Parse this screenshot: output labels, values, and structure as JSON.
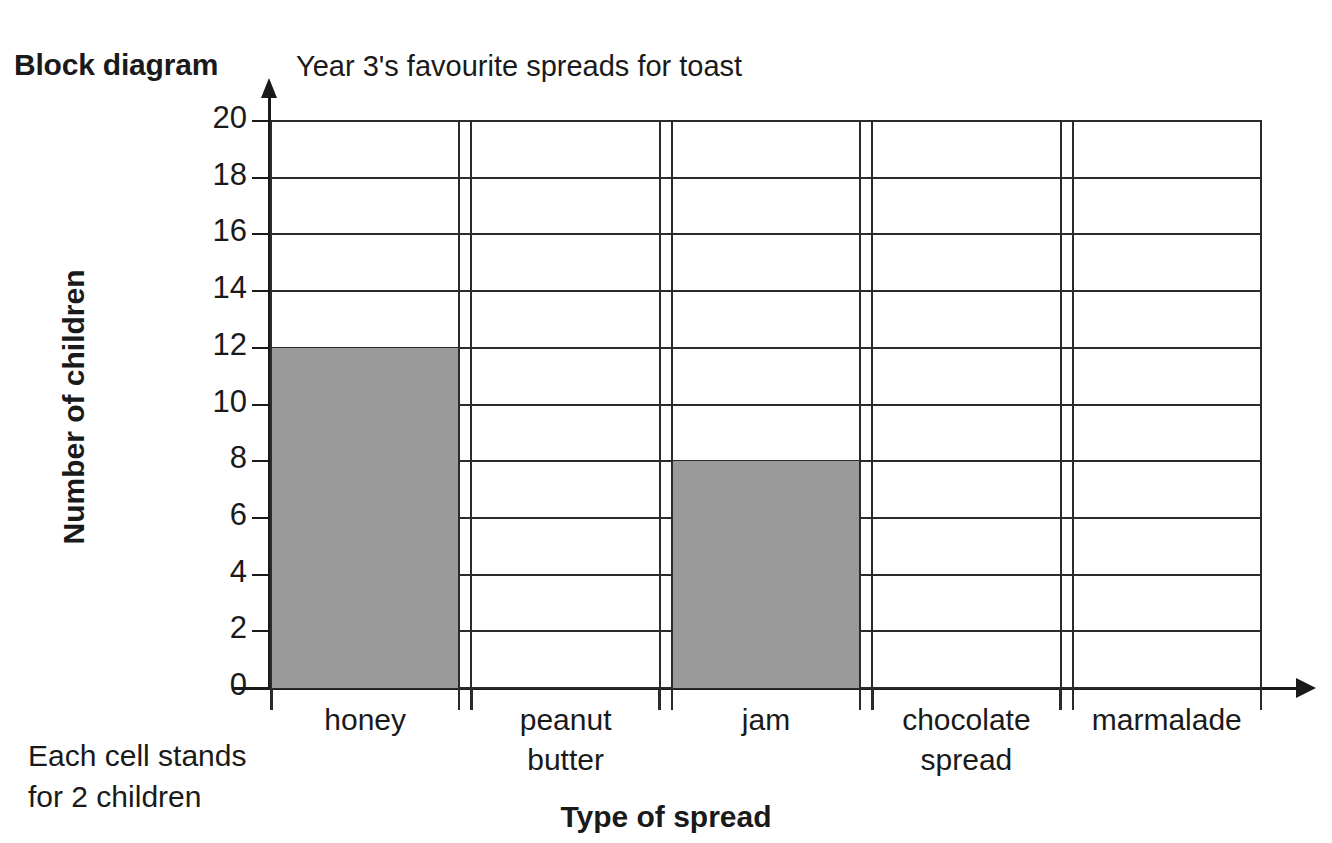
{
  "labels": {
    "block_diagram": "Block diagram",
    "footnote": "Each cell stands\nfor 2 children"
  },
  "chart_data": {
    "type": "bar",
    "title": "Year 3's favourite spreads for toast",
    "xlabel": "Type of spread",
    "ylabel": "Number of children",
    "categories": [
      "honey",
      "peanut\nbutter",
      "jam",
      "chocolate\nspread",
      "marmalade"
    ],
    "values": [
      12,
      0,
      8,
      0,
      0
    ],
    "ylim": [
      0,
      20
    ],
    "ytick_step": 2,
    "yticks": [
      "20",
      "18",
      "16",
      "14",
      "12",
      "10",
      "8",
      "6",
      "4",
      "2",
      "0"
    ],
    "grid": true,
    "legend": "none",
    "cell_value": 2,
    "bar_color": "#9a9a9a",
    "axis_color": "#1a1a1a",
    "grid_color": "#2b2b2b"
  }
}
